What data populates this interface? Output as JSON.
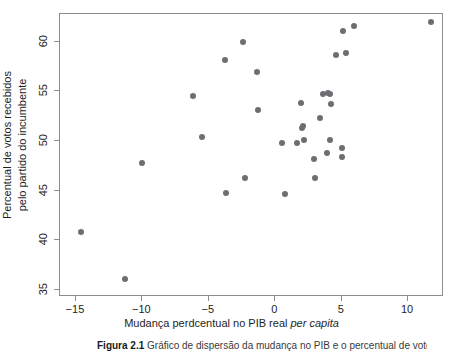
{
  "figure": {
    "caption_label": "Figura 2.1",
    "caption_text": "Gráfico de dispersão da mudança no PIB e o percentual de votos"
  },
  "chart_data": {
    "type": "scatter",
    "title": "",
    "xlabel_prefix": "Mudança perdcentual no PIB real ",
    "xlabel_italic": "per capita",
    "ylabel_line1": "Percentual de votos recebidos",
    "ylabel_line2": "pelo partido do incumbente",
    "xlim": [
      -16.2,
      12.7
    ],
    "ylim": [
      34.3,
      62.8
    ],
    "xticks": [
      -15,
      -10,
      -5,
      0,
      5,
      10
    ],
    "xticklabels": [
      "−15",
      "−10",
      "−5",
      "0",
      "5",
      "10"
    ],
    "yticks": [
      35,
      40,
      45,
      50,
      55,
      60
    ],
    "yticklabels": [
      "35",
      "40",
      "45",
      "50",
      "55",
      "60"
    ],
    "grid": false,
    "legend": null,
    "marker_color": "#6e6e72",
    "frame_color": "#8d8d8d",
    "points": [
      {
        "x": -14.6,
        "y": 40.8
      },
      {
        "x": -11.3,
        "y": 36.1
      },
      {
        "x": -10.0,
        "y": 47.8
      },
      {
        "x": -6.2,
        "y": 54.5
      },
      {
        "x": -5.5,
        "y": 50.4
      },
      {
        "x": -3.8,
        "y": 58.2
      },
      {
        "x": -3.7,
        "y": 44.8
      },
      {
        "x": -2.4,
        "y": 60.0
      },
      {
        "x": -2.3,
        "y": 46.3
      },
      {
        "x": -1.4,
        "y": 57.0
      },
      {
        "x": -1.3,
        "y": 53.1
      },
      {
        "x": 0.5,
        "y": 49.8
      },
      {
        "x": 0.7,
        "y": 44.7
      },
      {
        "x": 1.6,
        "y": 49.8
      },
      {
        "x": 1.9,
        "y": 53.8
      },
      {
        "x": 2.0,
        "y": 51.3
      },
      {
        "x": 2.1,
        "y": 51.5
      },
      {
        "x": 2.2,
        "y": 50.1
      },
      {
        "x": 2.9,
        "y": 48.2
      },
      {
        "x": 3.0,
        "y": 46.3
      },
      {
        "x": 3.4,
        "y": 52.3
      },
      {
        "x": 3.6,
        "y": 54.7
      },
      {
        "x": 3.9,
        "y": 48.8
      },
      {
        "x": 4.0,
        "y": 54.8
      },
      {
        "x": 4.1,
        "y": 50.1
      },
      {
        "x": 4.15,
        "y": 54.75
      },
      {
        "x": 4.2,
        "y": 53.7
      },
      {
        "x": 4.6,
        "y": 58.7
      },
      {
        "x": 5.0,
        "y": 48.4
      },
      {
        "x": 5.05,
        "y": 49.3
      },
      {
        "x": 5.1,
        "y": 61.1
      },
      {
        "x": 5.3,
        "y": 58.9
      },
      {
        "x": 5.9,
        "y": 61.6
      },
      {
        "x": 11.7,
        "y": 62.0
      }
    ]
  }
}
